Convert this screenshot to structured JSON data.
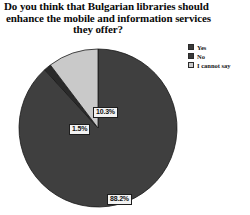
{
  "chart_data": {
    "type": "pie",
    "title": "Do you think that Bulgarian libraries should enhance the mobile and information services they offer?",
    "title_lines": [
      "Do you think that Bulgarian libraries should",
      "enhance the mobile and information services",
      "they offer?"
    ],
    "categories": [
      "Yes",
      "No",
      "I cannot say"
    ],
    "values": [
      88.2,
      1.5,
      10.3
    ],
    "value_labels": [
      "88.2%",
      "1.5%",
      "10.3%"
    ],
    "colors": [
      "#3f3f3f",
      "#2a2a2a",
      "#c9c9c9"
    ],
    "units": "percent",
    "start_angle_deg": 0,
    "direction": "clockwise",
    "legend_position": "top-right",
    "grid": false,
    "xlabel": "",
    "ylabel": ""
  },
  "legend": {
    "items": [
      {
        "label": "Yes"
      },
      {
        "label": "No"
      },
      {
        "label": "I cannot say"
      }
    ]
  },
  "labels": {
    "yes": "88.2%",
    "no": "1.5%",
    "cannot_say": "10.3%"
  }
}
